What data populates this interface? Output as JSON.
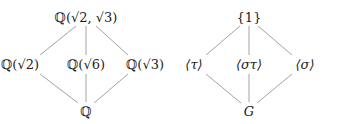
{
  "diagrams": [
    {
      "name": "field-lattice",
      "nodes": [
        {
          "id": "top",
          "label": "ℚ(√2, √3)",
          "x": 86,
          "y": 17
        },
        {
          "id": "left",
          "label": "ℚ(√2)",
          "x": 20,
          "y": 64
        },
        {
          "id": "mid",
          "label": "ℚ(√6)",
          "x": 86,
          "y": 64
        },
        {
          "id": "right",
          "label": "ℚ(√3)",
          "x": 145,
          "y": 64
        },
        {
          "id": "bottom",
          "label": "ℚ",
          "x": 86,
          "y": 111
        }
      ],
      "edges": [
        [
          "top",
          "left"
        ],
        [
          "top",
          "mid"
        ],
        [
          "top",
          "right"
        ],
        [
          "left",
          "bottom"
        ],
        [
          "mid",
          "bottom"
        ],
        [
          "right",
          "bottom"
        ]
      ]
    },
    {
      "name": "subgroup-lattice",
      "nodes": [
        {
          "id": "top",
          "label": "{1}",
          "x": 249,
          "y": 17
        },
        {
          "id": "left",
          "label": "⟨τ⟩",
          "x": 194,
          "y": 64
        },
        {
          "id": "mid",
          "label": "⟨στ⟩",
          "x": 249,
          "y": 64
        },
        {
          "id": "right",
          "label": "⟨σ⟩",
          "x": 305,
          "y": 64
        },
        {
          "id": "bottom",
          "label": "G",
          "x": 249,
          "y": 111
        }
      ],
      "edges": [
        [
          "top",
          "left"
        ],
        [
          "top",
          "mid"
        ],
        [
          "top",
          "right"
        ],
        [
          "left",
          "bottom"
        ],
        [
          "mid",
          "bottom"
        ],
        [
          "right",
          "bottom"
        ]
      ]
    }
  ],
  "style": {
    "line_color": "#8a8a8a",
    "text_color": "#222222"
  }
}
